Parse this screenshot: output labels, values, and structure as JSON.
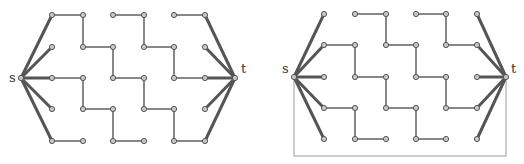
{
  "figures": [
    {
      "id": "left",
      "source": {
        "label": "s",
        "x": 21,
        "y": 78
      },
      "sink": {
        "label": "t",
        "x": 235,
        "y": 78
      },
      "columns": [
        52,
        83,
        113,
        144,
        174,
        205
      ],
      "rows": [
        15,
        47,
        78,
        109,
        141
      ],
      "thin_edges": [
        [
          [
            0,
            0
          ],
          [
            1,
            0
          ]
        ],
        [
          [
            2,
            0
          ],
          [
            3,
            0
          ]
        ],
        [
          [
            4,
            0
          ],
          [
            5,
            0
          ]
        ],
        [
          [
            1,
            0
          ],
          [
            1,
            1
          ]
        ],
        [
          [
            3,
            0
          ],
          [
            3,
            1
          ]
        ],
        [
          [
            1,
            1
          ],
          [
            2,
            1
          ]
        ],
        [
          [
            3,
            1
          ],
          [
            4,
            1
          ]
        ],
        [
          [
            2,
            1
          ],
          [
            2,
            2
          ]
        ],
        [
          [
            4,
            1
          ],
          [
            4,
            2
          ]
        ],
        [
          [
            0,
            2
          ],
          [
            1,
            2
          ]
        ],
        [
          [
            2,
            2
          ],
          [
            3,
            2
          ]
        ],
        [
          [
            4,
            2
          ],
          [
            5,
            2
          ]
        ],
        [
          [
            1,
            2
          ],
          [
            1,
            3
          ]
        ],
        [
          [
            3,
            2
          ],
          [
            3,
            3
          ]
        ],
        [
          [
            1,
            3
          ],
          [
            2,
            3
          ]
        ],
        [
          [
            3,
            3
          ],
          [
            4,
            3
          ]
        ],
        [
          [
            2,
            3
          ],
          [
            2,
            4
          ]
        ],
        [
          [
            4,
            3
          ],
          [
            4,
            4
          ]
        ],
        [
          [
            0,
            4
          ],
          [
            1,
            4
          ]
        ],
        [
          [
            2,
            4
          ],
          [
            3,
            4
          ]
        ],
        [
          [
            4,
            4
          ],
          [
            5,
            4
          ]
        ]
      ],
      "source_edges": [
        [
          0,
          0
        ],
        [
          0,
          1
        ],
        [
          0,
          2
        ],
        [
          0,
          3
        ],
        [
          0,
          4
        ]
      ],
      "sink_edges": [
        [
          5,
          0
        ],
        [
          5,
          1
        ],
        [
          5,
          2
        ],
        [
          5,
          3
        ],
        [
          5,
          4
        ]
      ],
      "nodes": [
        [
          0,
          0
        ],
        [
          1,
          0
        ],
        [
          2,
          0
        ],
        [
          3,
          0
        ],
        [
          4,
          0
        ],
        [
          5,
          0
        ],
        [
          0,
          1
        ],
        [
          1,
          1
        ],
        [
          2,
          1
        ],
        [
          3,
          1
        ],
        [
          4,
          1
        ],
        [
          5,
          1
        ],
        [
          0,
          2
        ],
        [
          1,
          2
        ],
        [
          2,
          2
        ],
        [
          3,
          2
        ],
        [
          4,
          2
        ],
        [
          5,
          2
        ],
        [
          0,
          3
        ],
        [
          1,
          3
        ],
        [
          2,
          3
        ],
        [
          3,
          3
        ],
        [
          4,
          3
        ],
        [
          5,
          3
        ],
        [
          0,
          4
        ],
        [
          1,
          4
        ],
        [
          2,
          4
        ],
        [
          3,
          4
        ],
        [
          4,
          4
        ],
        [
          5,
          4
        ]
      ],
      "box": null
    },
    {
      "id": "right",
      "source": {
        "label": "s",
        "x": 294,
        "y": 77
      },
      "sink": {
        "label": "t",
        "x": 506,
        "y": 77
      },
      "columns": [
        324,
        355,
        386,
        416,
        446,
        477
      ],
      "rows": [
        14,
        45,
        77,
        108,
        139
      ],
      "thin_edges": [
        [
          [
            1,
            0
          ],
          [
            2,
            0
          ]
        ],
        [
          [
            3,
            0
          ],
          [
            4,
            0
          ]
        ],
        [
          [
            2,
            0
          ],
          [
            2,
            1
          ]
        ],
        [
          [
            4,
            0
          ],
          [
            4,
            1
          ]
        ],
        [
          [
            0,
            1
          ],
          [
            1,
            1
          ]
        ],
        [
          [
            2,
            1
          ],
          [
            3,
            1
          ]
        ],
        [
          [
            4,
            1
          ],
          [
            5,
            1
          ]
        ],
        [
          [
            1,
            1
          ],
          [
            1,
            2
          ]
        ],
        [
          [
            3,
            1
          ],
          [
            3,
            2
          ]
        ],
        [
          [
            1,
            2
          ],
          [
            2,
            2
          ]
        ],
        [
          [
            3,
            2
          ],
          [
            4,
            2
          ]
        ],
        [
          [
            2,
            2
          ],
          [
            2,
            3
          ]
        ],
        [
          [
            4,
            2
          ],
          [
            4,
            3
          ]
        ],
        [
          [
            0,
            3
          ],
          [
            1,
            3
          ]
        ],
        [
          [
            2,
            3
          ],
          [
            3,
            3
          ]
        ],
        [
          [
            4,
            3
          ],
          [
            5,
            3
          ]
        ],
        [
          [
            1,
            3
          ],
          [
            1,
            4
          ]
        ],
        [
          [
            3,
            3
          ],
          [
            3,
            4
          ]
        ],
        [
          [
            1,
            4
          ],
          [
            2,
            4
          ]
        ],
        [
          [
            3,
            4
          ],
          [
            4,
            4
          ]
        ]
      ],
      "source_edges": [
        [
          0,
          0
        ],
        [
          0,
          1
        ],
        [
          0,
          2
        ],
        [
          0,
          3
        ],
        [
          0,
          4
        ]
      ],
      "sink_edges": [
        [
          5,
          0
        ],
        [
          5,
          1
        ],
        [
          5,
          2
        ],
        [
          5,
          3
        ],
        [
          5,
          4
        ]
      ],
      "nodes": [
        [
          0,
          0
        ],
        [
          1,
          0
        ],
        [
          2,
          0
        ],
        [
          3,
          0
        ],
        [
          4,
          0
        ],
        [
          5,
          0
        ],
        [
          0,
          1
        ],
        [
          1,
          1
        ],
        [
          2,
          1
        ],
        [
          3,
          1
        ],
        [
          4,
          1
        ],
        [
          5,
          1
        ],
        [
          0,
          2
        ],
        [
          1,
          2
        ],
        [
          2,
          2
        ],
        [
          3,
          2
        ],
        [
          4,
          2
        ],
        [
          5,
          2
        ],
        [
          0,
          3
        ],
        [
          1,
          3
        ],
        [
          2,
          3
        ],
        [
          3,
          3
        ],
        [
          4,
          3
        ],
        [
          5,
          3
        ],
        [
          0,
          4
        ],
        [
          1,
          4
        ],
        [
          2,
          4
        ],
        [
          3,
          4
        ],
        [
          4,
          4
        ],
        [
          5,
          4
        ]
      ],
      "box": {
        "bottom_y": 156
      }
    }
  ],
  "colors": {
    "thin_edge": "#6a6a6a",
    "thick_edge": "#555555",
    "node_fill": "#c8c8c8",
    "box": "#9a9a9a"
  }
}
